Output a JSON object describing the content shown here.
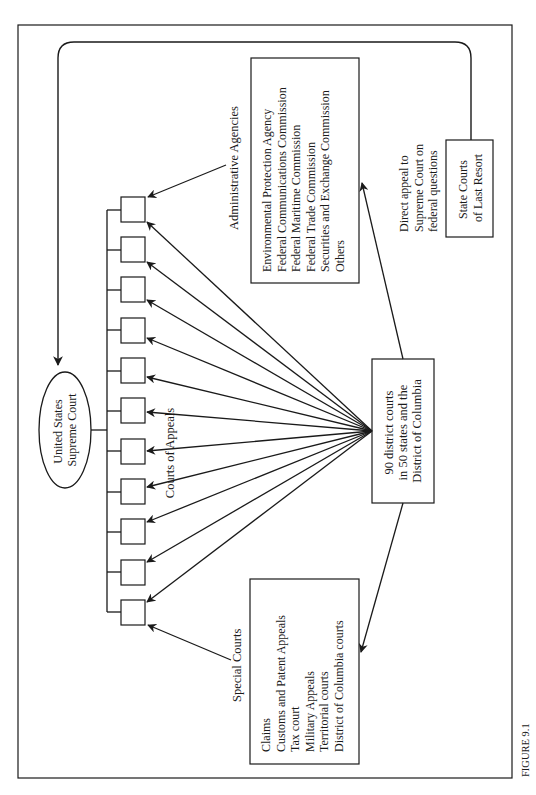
{
  "figure": {
    "label": "FIGURE 9.1"
  },
  "supreme_court": {
    "line1": "United States",
    "line2": "Supreme Court"
  },
  "courts_of_appeals": {
    "label": "Courts of Appeals",
    "count": 11
  },
  "district_courts": {
    "line1": "90 district courts",
    "line2": "in 50 states and the",
    "line3": "District of Columbia"
  },
  "administrative_agencies": {
    "label": "Administrative Agencies",
    "items": [
      "Environmental Protection Agency",
      "Federal Communications Commission",
      "Federal Maritime Commission",
      "Federal Trade Commission",
      "Securities and Exchange Commission",
      "Others"
    ]
  },
  "special_courts": {
    "label": "Special Courts",
    "items": [
      "Claims",
      "Customs and Patent Appeals",
      "Tax court",
      "Military Appeals",
      "Territorial courts",
      "District of Columbia courts"
    ]
  },
  "state_courts": {
    "line1": "State Courts",
    "line2": "of Last Resort"
  },
  "direct_appeal": {
    "line1": "Direct appeal to",
    "line2": "Supreme Court on",
    "line3": "federal questions"
  }
}
